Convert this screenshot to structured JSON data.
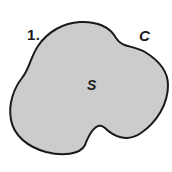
{
  "figure": {
    "kind": "math-region-diagram",
    "problem_number": "1.",
    "curve_label": "C",
    "region_label": "S",
    "background_color": "#ffffff",
    "fill_color": "#cccccc",
    "stroke_color": "#1a1a1a",
    "stroke_width": "2",
    "canvas": {
      "width": 172,
      "height": 172
    },
    "shape": {
      "description": "closed kidney-shaped planar region with smooth boundary curve",
      "path": "M 80 22 C 97 21 110 27 116 38 C 122 48 133 45 145 52 C 158 60 168 70 168 85 C 168 104 157 122 141 133 C 127 143 113 136 105 128 C 97 120 89 134 85 145 C 80 155 62 156 46 152 C 28 147 14 136 11 120 C 8 104 14 88 22 78 C 30 68 30 58 38 46 C 48 31 64 23 80 22 Z"
    }
  }
}
